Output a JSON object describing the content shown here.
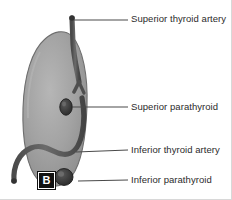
{
  "figure": {
    "panel_letter": "B",
    "background_color": "#ffffff",
    "border_color": "#d8d8d8"
  },
  "colors": {
    "lobe_fill": "#9a9a9a",
    "lobe_fill_light": "#b0b0b0",
    "lobe_edge": "#6e6e6e",
    "artery": "#595959",
    "artery_edge": "#3d3d3d",
    "parathyroid": "#3a3a3a",
    "parathyroid_edge": "#262626",
    "leader_line": "#4a4a4a",
    "text": "#2b2b2b",
    "panel_box": "#111111",
    "panel_text": "#ffffff"
  },
  "labels": [
    {
      "id": "superior-thyroid-artery",
      "text": "Superior thyroid artery",
      "leader": {
        "x1": 74,
        "y1": 20,
        "x2": 128,
        "y2": 20
      }
    },
    {
      "id": "superior-parathyroid",
      "text": "Superior parathyroid",
      "leader": {
        "x1": 72,
        "y1": 107,
        "x2": 128,
        "y2": 107
      }
    },
    {
      "id": "inferior-thyroid-artery",
      "text": "Inferior thyroid artery",
      "leader": {
        "x1": 76,
        "y1": 152,
        "x2": 128,
        "y2": 150
      }
    },
    {
      "id": "inferior-parathyroid",
      "text": "Inferior parathyroid",
      "leader": {
        "x1": 78,
        "y1": 181,
        "x2": 128,
        "y2": 180
      }
    }
  ],
  "structures": [
    {
      "id": "thyroid-lobe",
      "name": "thyroid lobe"
    },
    {
      "id": "superior-thyroid-artery-vessel",
      "name": "superior thyroid artery"
    },
    {
      "id": "inferior-thyroid-artery-vessel",
      "name": "inferior thyroid artery"
    },
    {
      "id": "superior-parathyroid-gland",
      "name": "superior parathyroid gland"
    },
    {
      "id": "inferior-parathyroid-gland",
      "name": "inferior parathyroid gland"
    }
  ]
}
